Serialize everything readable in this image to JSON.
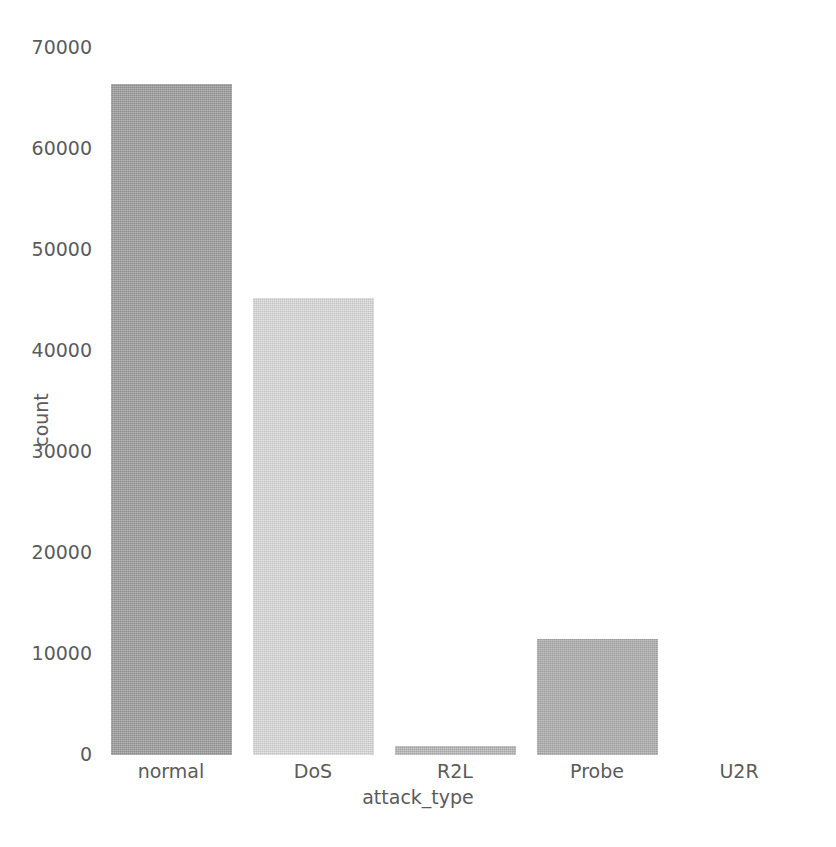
{
  "chart_data": {
    "type": "bar",
    "title": "",
    "subtitle": "",
    "xlabel": "attack_type",
    "ylabel": "count",
    "categories": [
      "normal",
      "DoS",
      "R2L",
      "Probe",
      "U2R"
    ],
    "values": [
      67340,
      45930,
      900,
      11660,
      50
    ],
    "series": [
      {
        "name": "count",
        "values": [
          67340,
          45930,
          900,
          11660,
          50
        ]
      }
    ],
    "ylim": [
      0,
      71000
    ],
    "yticks": [
      0,
      10000,
      20000,
      30000,
      40000,
      50000,
      60000,
      70000
    ],
    "ytick_labels": [
      "0",
      "10000",
      "20000",
      "30000",
      "40000",
      "50000",
      "60000",
      "70000"
    ],
    "xtick_labels": [
      "normal",
      "DoS",
      "R2L",
      "Probe",
      "U2R"
    ],
    "grid": false,
    "legend": false,
    "legend_position": "none",
    "bar_colors": [
      "#9a9a9a",
      "#d7d7d7",
      "#b5b5b5",
      "#ababab",
      "#b0b0b0"
    ],
    "background_color": "#ffffff",
    "text_color": "#5b5b5b",
    "annotations": []
  },
  "axes": {
    "y": {
      "label": "count",
      "ticks": [
        {
          "value": 70000,
          "label": "70000"
        },
        {
          "value": 60000,
          "label": "60000"
        },
        {
          "value": 50000,
          "label": "50000"
        },
        {
          "value": 40000,
          "label": "40000"
        },
        {
          "value": 30000,
          "label": "30000"
        },
        {
          "value": 20000,
          "label": "20000"
        },
        {
          "value": 10000,
          "label": "10000"
        },
        {
          "value": 0,
          "label": "0"
        }
      ]
    },
    "x": {
      "label": "attack_type",
      "ticks": [
        {
          "label": "normal"
        },
        {
          "label": "DoS"
        },
        {
          "label": "R2L"
        },
        {
          "label": "Probe"
        },
        {
          "label": "U2R"
        }
      ]
    }
  }
}
